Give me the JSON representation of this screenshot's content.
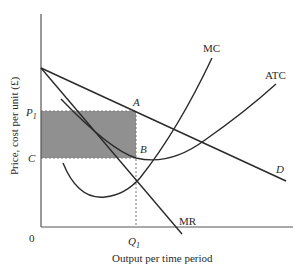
{
  "diagram": {
    "type": "monopoly profit maximization",
    "y_axis_label": "Price, cost per unit (£)",
    "x_axis_label": "Output per time period",
    "origin_label": "0",
    "curves": {
      "mc": "MC",
      "atc": "ATC",
      "d": "D",
      "mr": "MR"
    },
    "points": {
      "a": "A",
      "b": "B"
    },
    "price_label": "P",
    "price_sub": "1",
    "cost_label": "C",
    "quantity_label": "Q",
    "quantity_sub": "1",
    "colors": {
      "line": "#2a2a2a",
      "shaded": "#8a8a8a",
      "dashed": "#7a7a7a"
    }
  }
}
